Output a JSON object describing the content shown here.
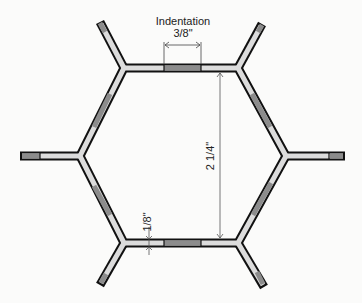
{
  "diagram": {
    "labels": {
      "indentation_title": "Indentation",
      "indentation_value": "3/8\"",
      "height_value": "2 1/4\"",
      "wall_value": "1/8\""
    },
    "colors": {
      "background": "#fbfbfa",
      "wall_fill": "#dcdcdc",
      "indent_fill": "#8c8c8c",
      "outline": "#111111",
      "dim_line": "#555555"
    }
  }
}
